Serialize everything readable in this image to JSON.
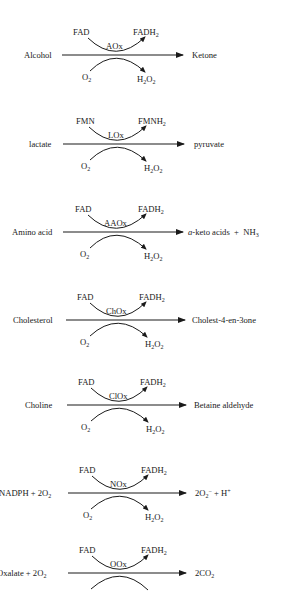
{
  "reactions": [
    {
      "substrate": "Alcohol",
      "product": "Ketone",
      "enzyme": "AOx",
      "cofactor_in": "FAD",
      "cofactor_out": "FADH",
      "cofactor_out_sub": "2",
      "o2": "O",
      "o2_sub": "2",
      "h2o2_a": "H",
      "h2o2_sub1": "2",
      "h2o2_b": "O",
      "h2o2_sub2": "2"
    },
    {
      "substrate": "lactate",
      "product": "pyruvate",
      "enzyme": "LOx",
      "cofactor_in": "FMN",
      "cofactor_out": "FMNH",
      "cofactor_out_sub": "2",
      "o2": "O",
      "o2_sub": "2",
      "h2o2_a": "H",
      "h2o2_sub1": "2",
      "h2o2_b": "O",
      "h2o2_sub2": "2"
    },
    {
      "substrate": "Amino acid",
      "product_italic": "a",
      "product": "-keto acids  +  NH",
      "product_sub": "3",
      "enzyme": "AAOx",
      "cofactor_in": "FAD",
      "cofactor_out": "FADH",
      "cofactor_out_sub": "2",
      "o2": "O",
      "o2_sub": "2",
      "h2o2_a": "H",
      "h2o2_sub1": "2",
      "h2o2_b": "O",
      "h2o2_sub2": "2"
    },
    {
      "substrate": "Cholesterol",
      "product": "Cholest-4-en-3one",
      "enzyme": "ChOx",
      "cofactor_in": "FAD",
      "cofactor_out": "FADH",
      "cofactor_out_sub": "2",
      "o2": "O",
      "o2_sub": "2",
      "h2o2_a": "H",
      "h2o2_sub1": "2",
      "h2o2_b": "O",
      "h2o2_sub2": "2"
    },
    {
      "substrate": "Choline",
      "product": "Betaine aldehyde",
      "enzyme": "ClOx",
      "cofactor_in": "FAD",
      "cofactor_out": "FADH",
      "cofactor_out_sub": "2",
      "o2": "O",
      "o2_sub": "2",
      "h2o2_a": "H",
      "h2o2_sub1": "2",
      "h2o2_b": "O",
      "h2o2_sub2": "2"
    },
    {
      "substrate": "NADPH + 2O",
      "substrate_sub": "2",
      "product": "2O",
      "product_sub": "2",
      "product_sup": "−",
      "product_tail": " + H",
      "product_tail_sup": "+",
      "enzyme": "NOx",
      "cofactor_in": "FAD",
      "cofactor_out": "FADH",
      "cofactor_out_sub": "2",
      "o2": "O",
      "o2_sub": "2",
      "h2o2_a": "H",
      "h2o2_sub1": "2",
      "h2o2_b": "O",
      "h2o2_sub2": "2"
    },
    {
      "substrate": "Oxalate + 2O",
      "substrate_sub": "2",
      "product": "2CO",
      "product_sub": "2",
      "enzyme": "OOx",
      "cofactor_in": "FAD",
      "cofactor_out": "FADH",
      "cofactor_out_sub": "2"
    }
  ]
}
